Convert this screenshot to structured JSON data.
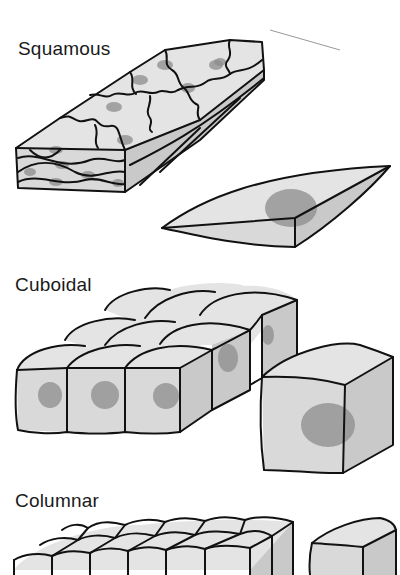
{
  "figure": {
    "panels": [
      {
        "label": "Squamous",
        "description": "Sheet of flat, irregular cells with an isolated flattened cell"
      },
      {
        "label": "Cuboidal",
        "description": "Block of cube-shaped cells with an isolated cuboidal cell"
      },
      {
        "label": "Columnar",
        "description": "Block of tall columnar cells with an isolated columnar cell"
      }
    ],
    "colors": {
      "background": "#ffffff",
      "cell": "#d9d9d9",
      "nucleus": "#8c8c8c",
      "outline": "#111111"
    }
  }
}
